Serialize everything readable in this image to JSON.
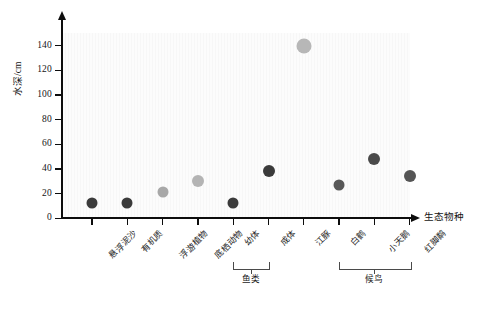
{
  "chart_data": {
    "type": "scatter",
    "title": "",
    "xlabel": "生态物种",
    "ylabel": "水深/cm",
    "ylim": [
      0,
      150
    ],
    "yticks": [
      0,
      20,
      40,
      60,
      80,
      100,
      120,
      140
    ],
    "ytick_labels": [
      "0",
      "20",
      "40",
      "60",
      "80",
      "100",
      "120",
      "140"
    ],
    "grid": false,
    "legend": "none",
    "categories": [
      "悬浮泥沙",
      "有机质",
      "浮游植物",
      "底栖动物",
      "幼体",
      "成体",
      "江豚",
      "白鹤",
      "小天鹅",
      "红脚鹬"
    ],
    "values": [
      12,
      12,
      21,
      30,
      12,
      38,
      140,
      27,
      48,
      34
    ],
    "point_colors": [
      "#3b3b3b",
      "#3b3b3b",
      "#a8a8a8",
      "#b4b4b4",
      "#3b3b3b",
      "#3a3a3a",
      "#b7b7b7",
      "#585858",
      "#4a4a4a",
      "#555555"
    ],
    "point_sizes": [
      11,
      11,
      11,
      12,
      11,
      12,
      15,
      11,
      12,
      12
    ],
    "groups": [
      {
        "label": "鱼类",
        "from": 4,
        "to": 5
      },
      {
        "label": "候鸟",
        "from": 7,
        "to": 9
      }
    ]
  },
  "figure": {
    "caption": ""
  },
  "colors": {
    "axis": "#0d0d0d",
    "plot_background": "#f7f7f7",
    "text": "#141414"
  }
}
